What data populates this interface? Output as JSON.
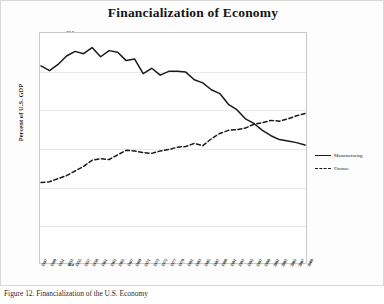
{
  "figure": {
    "caption": "Figure 12.  Financialization of the U.S. Economy"
  },
  "chart_data": {
    "type": "line",
    "title": "Financialization of Economy",
    "xlabel": "",
    "ylabel": "Percent of U.S. GDP",
    "ylim": [
      0.0,
      30.0
    ],
    "yticks": [
      "0.0",
      "5.0",
      "10.0",
      "15.0",
      "20.0",
      "25.0",
      "30.0"
    ],
    "ytick_values": [
      0.0,
      5.0,
      10.0,
      15.0,
      20.0,
      25.0,
      30.0
    ],
    "grid": true,
    "legend_position": "right",
    "categories": [
      "1947",
      "1949",
      "1951",
      "1953",
      "1955",
      "1957",
      "1959",
      "1961",
      "1963",
      "1965",
      "1967",
      "1969",
      "1971",
      "1973",
      "1975",
      "1977",
      "1979",
      "1981",
      "1983",
      "1985",
      "1987",
      "1989",
      "1991",
      "1993",
      "1995",
      "1997",
      "1999",
      "2001",
      "2003",
      "2005",
      "2007",
      "2009"
    ],
    "series": [
      {
        "name": "Manufacturing",
        "style": "solid",
        "color": "#1a1a1a",
        "values": [
          25.7,
          25.1,
          25.9,
          27.0,
          27.6,
          27.3,
          28.1,
          26.9,
          27.7,
          27.5,
          26.4,
          26.6,
          24.7,
          25.4,
          24.5,
          25.0,
          25.0,
          24.9,
          23.9,
          23.5,
          22.6,
          22.1,
          20.7,
          20.0,
          18.8,
          18.2,
          17.3,
          16.6,
          16.1,
          15.9,
          15.7,
          15.4
        ]
      },
      {
        "name": "Finance",
        "style": "dashed",
        "color": "#1a1a1a",
        "values": [
          10.5,
          10.6,
          11.0,
          11.4,
          12.0,
          12.6,
          13.4,
          13.6,
          13.5,
          14.1,
          14.7,
          14.6,
          14.4,
          14.3,
          14.6,
          14.8,
          15.1,
          15.2,
          15.6,
          15.3,
          16.2,
          16.9,
          17.3,
          17.4,
          17.6,
          18.1,
          18.3,
          18.6,
          18.5,
          18.8,
          19.2,
          19.5
        ]
      }
    ]
  }
}
